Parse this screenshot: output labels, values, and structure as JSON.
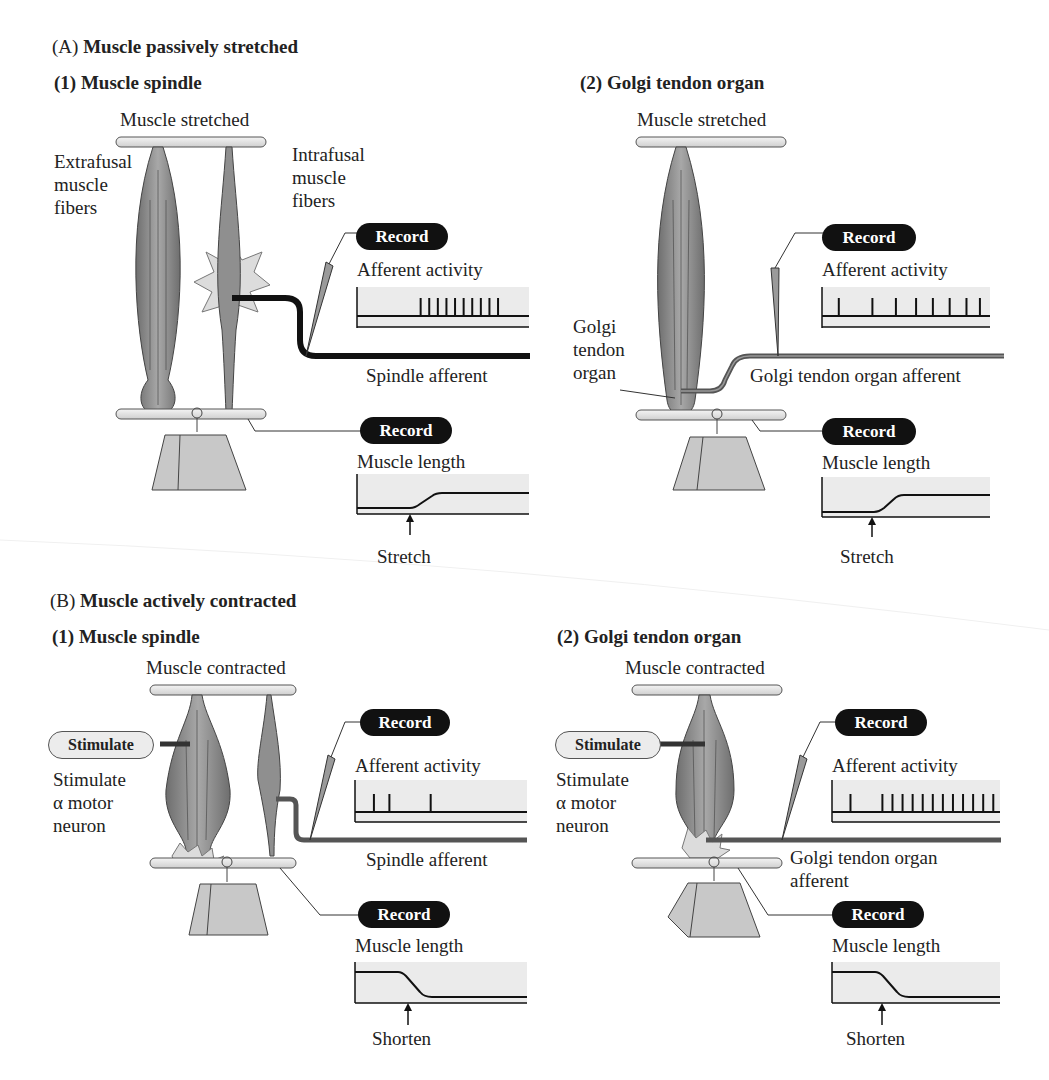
{
  "panel_a": {
    "letter": "(A)",
    "title": "Muscle passively stretched",
    "spindle": {
      "heading": "(1)  Muscle spindle",
      "state_label": "Muscle stretched",
      "extrafusal_label": [
        "Extrafusal",
        "muscle",
        "fibers"
      ],
      "intrafusal_label": [
        "Intrafusal",
        "muscle",
        "fibers"
      ],
      "record_top": "Record",
      "afferent_label": "Afferent activity",
      "afferent_name": "Spindle afferent",
      "record_bottom": "Record",
      "length_label": "Muscle length",
      "event_label": "Stretch"
    },
    "gto": {
      "heading": "(2)  Golgi tendon organ",
      "state_label": "Muscle stretched",
      "gto_label": [
        "Golgi",
        "tendon",
        "organ"
      ],
      "record_top": "Record",
      "afferent_label": "Afferent activity",
      "afferent_name": "Golgi tendon organ afferent",
      "record_bottom": "Record",
      "length_label": "Muscle length",
      "event_label": "Stretch"
    }
  },
  "panel_b": {
    "letter": "(B)",
    "title": "Muscle actively contracted",
    "spindle": {
      "heading": "(1)  Muscle spindle",
      "state_label": "Muscle contracted",
      "stimulate_button": "Stimulate",
      "stimulate_desc": [
        "Stimulate",
        "α motor",
        "neuron"
      ],
      "record_top": "Record",
      "afferent_label": "Afferent activity",
      "afferent_name": "Spindle afferent",
      "record_bottom": "Record",
      "length_label": "Muscle length",
      "event_label": "Shorten"
    },
    "gto": {
      "heading": "(2)  Golgi tendon organ",
      "state_label": "Muscle contracted",
      "stimulate_button": "Stimulate",
      "stimulate_desc": [
        "Stimulate",
        "α motor",
        "neuron"
      ],
      "record_top": "Record",
      "afferent_label": "Afferent activity",
      "afferent_name": [
        "Golgi tendon organ",
        "afferent"
      ],
      "record_bottom": "Record",
      "length_label": "Muscle length",
      "event_label": "Shorten"
    }
  },
  "traces": {
    "a_spindle_spikes": [
      0.37,
      0.42,
      0.47,
      0.52,
      0.57,
      0.62,
      0.67,
      0.72,
      0.77,
      0.82
    ],
    "a_gto_spikes": [
      0.1,
      0.3,
      0.44,
      0.56,
      0.66,
      0.76,
      0.86,
      0.94
    ],
    "b_spindle_spikes": [
      0.11,
      0.2,
      0.44
    ],
    "b_gto_spikes": [
      0.11,
      0.3,
      0.36,
      0.42,
      0.48,
      0.54,
      0.6,
      0.66,
      0.72,
      0.78,
      0.84,
      0.9,
      0.96
    ],
    "colors": {
      "trace_bg": "#ebebeb",
      "trace_line": "#111111",
      "muscle": "#8a8a8a",
      "pill": "#111111",
      "burst": "#dcdcdc"
    }
  }
}
